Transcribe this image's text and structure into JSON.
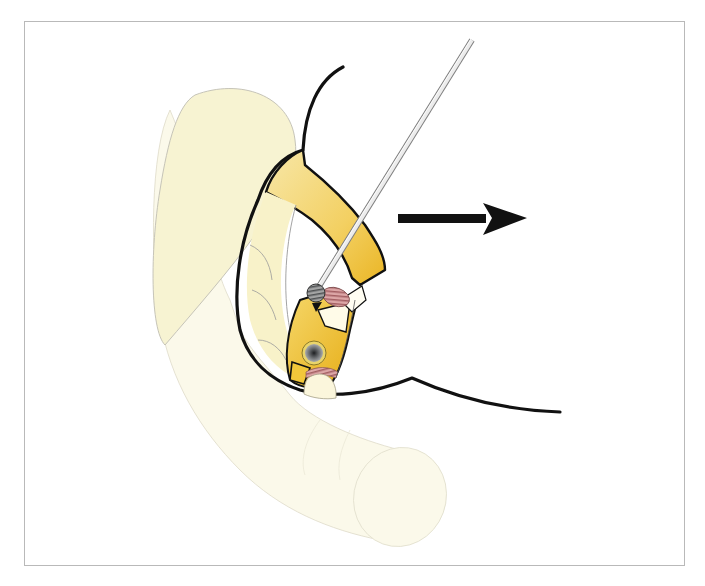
{
  "figure": {
    "caption": "",
    "colors": {
      "background": "#ffffff",
      "frame_border": "#b9b9b9",
      "outline": "#111111",
      "organ_pale": "#f8f4d6",
      "organ_faint": "#fbf9ea",
      "organ_outline": "#c9c7bb",
      "wall_yellow_light": "#f6e39b",
      "wall_yellow": "#f2c73a",
      "wall_yellow_deep": "#e9b31c",
      "instrument_shaft": "#e6e6e6",
      "instrument_edge": "#8a8a8a",
      "tip_gray": "#8f9090",
      "tissue_pink": "#d8a0a0",
      "papilla_dark": "#3a3d3f",
      "arrow": "#111111"
    },
    "elements": {
      "arrow": {
        "direction": "right",
        "label": ""
      },
      "instrument": {
        "label": ""
      },
      "papilla": {
        "label": ""
      }
    }
  }
}
